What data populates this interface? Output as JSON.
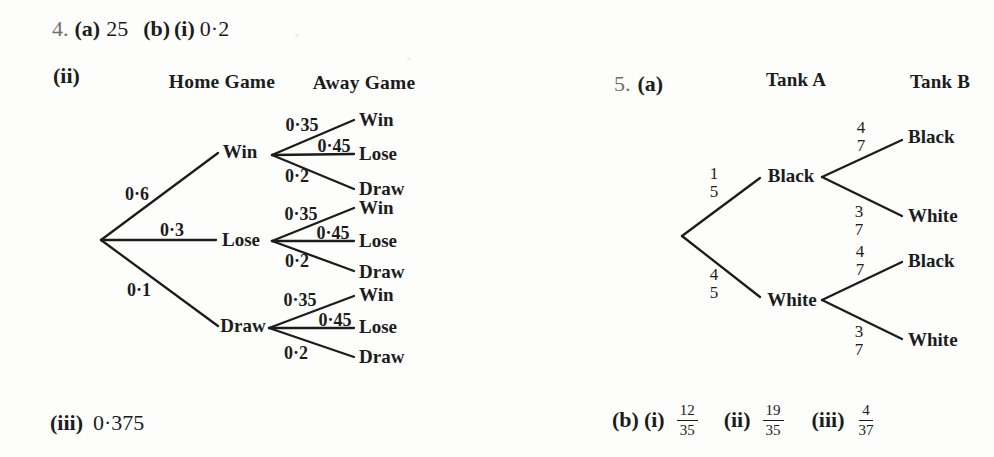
{
  "colors": {
    "background": "#fdfdfc",
    "ink": "#1c1c1c",
    "question_number_gray": "#6f6f6f",
    "branch_line": "#1c1c1c"
  },
  "q4": {
    "number": "4.",
    "part_a_label": "(a)",
    "part_a_value": "25",
    "part_b_label": "(b)",
    "part_bi_label": "(i)",
    "part_bi_value": "0·2",
    "part_bii_label": "(ii)",
    "part_biii_label": "(iii)",
    "part_biii_value": "0·375",
    "tree": {
      "col1_header": "Home Game",
      "col2_header": "Away Game",
      "branches": [
        {
          "prob": "0·6",
          "node": "Win"
        },
        {
          "prob": "0·3",
          "node": "Lose"
        },
        {
          "prob": "0·1",
          "node": "Draw"
        }
      ],
      "fans": [
        {
          "probs": [
            "0·35",
            "0·45",
            "0·2"
          ],
          "leaves": [
            "Win",
            "Lose",
            "Draw"
          ]
        },
        {
          "probs": [
            "0·35",
            "0·45",
            "0·2"
          ],
          "leaves": [
            "Win",
            "Lose",
            "Draw"
          ]
        },
        {
          "probs": [
            "0·35",
            "0·45",
            "0·2"
          ],
          "leaves": [
            "Win",
            "Lose",
            "Draw"
          ]
        }
      ]
    }
  },
  "q5": {
    "number": "5.",
    "part_a_label": "(a)",
    "tree": {
      "col1_header": "Tank A",
      "col2_header": "Tank B",
      "branches": [
        {
          "num": "1",
          "den": "5",
          "node": "Black"
        },
        {
          "num": "4",
          "den": "5",
          "node": "White"
        }
      ],
      "fans": [
        {
          "subbranches": [
            {
              "num": "4",
              "den": "7",
              "leaf": "Black"
            },
            {
              "num": "3",
              "den": "7",
              "leaf": "White"
            }
          ]
        },
        {
          "subbranches": [
            {
              "num": "4",
              "den": "7",
              "leaf": "Black"
            },
            {
              "num": "3",
              "den": "7",
              "leaf": "White"
            }
          ]
        }
      ]
    },
    "part_b_label": "(b)",
    "part_b_answers": [
      {
        "label": "(i)",
        "num": "12",
        "den": "35"
      },
      {
        "label": "(ii)",
        "num": "19",
        "den": "35"
      },
      {
        "label": "(iii)",
        "num": "4",
        "den": "37"
      }
    ]
  }
}
